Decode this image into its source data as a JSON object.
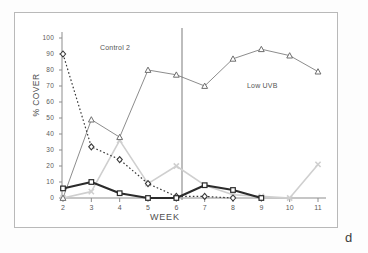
{
  "figure": {
    "panel_letter": "d",
    "annotations": [
      {
        "name": "control-2",
        "text": "Control 2"
      },
      {
        "name": "low-uvb",
        "text": "Low UVB"
      }
    ]
  },
  "chart_data": {
    "type": "line",
    "title": "",
    "xlabel": "WEEK",
    "ylabel": "% COVER",
    "xlim": [
      2,
      11
    ],
    "ylim": [
      0,
      100
    ],
    "grid": false,
    "legend": "none",
    "xticks": [
      "2",
      "3",
      "4",
      "5",
      "6",
      "7",
      "8",
      "9",
      "10",
      "11"
    ],
    "yticks": [
      "0",
      "10",
      "20",
      "30",
      "40",
      "50",
      "60",
      "70",
      "80",
      "90",
      "100"
    ],
    "x": [
      2,
      3,
      4,
      5,
      6,
      7,
      8,
      9,
      10,
      11
    ],
    "annotations": [
      {
        "text": "Control 2",
        "x": 3.3,
        "y": 95
      },
      {
        "text": "Low UVB",
        "x": 8.5,
        "y": 70
      },
      {
        "text": "d",
        "x": 11.5,
        "y": -10
      }
    ],
    "vertical_divider": {
      "x": 6.2,
      "label": "treatment-start",
      "color": "#9a9a9a"
    },
    "series": [
      {
        "name": "series-diamond-dotted",
        "marker": "diamond",
        "linestyle": "dotted",
        "color": "#3a3a3a",
        "x": [
          2,
          3,
          4,
          5,
          6,
          7,
          8
        ],
        "values": [
          90,
          32,
          24,
          9,
          1,
          1,
          0
        ]
      },
      {
        "name": "series-triangle",
        "marker": "triangle",
        "linestyle": "solid-thin",
        "color": "#6e6e6e",
        "x": [
          2,
          3,
          4,
          5,
          6,
          7,
          8,
          9,
          10,
          11
        ],
        "values": [
          0,
          49,
          38,
          80,
          77,
          70,
          87,
          93,
          89,
          79
        ]
      },
      {
        "name": "series-x-grey",
        "marker": "x",
        "linestyle": "solid-light",
        "color": "#cfcfcf",
        "x": [
          2,
          3,
          4,
          5,
          6,
          7,
          8,
          9,
          10,
          11
        ],
        "values": [
          0,
          4,
          36,
          9,
          20,
          8,
          2,
          1,
          0,
          21
        ]
      },
      {
        "name": "series-square-bold",
        "marker": "square",
        "linestyle": "solid-bold",
        "color": "#2b2b2b",
        "x": [
          2,
          3,
          4,
          5,
          6,
          7,
          8,
          9
        ],
        "values": [
          6,
          10,
          3,
          0,
          0,
          8,
          5,
          0
        ]
      }
    ]
  }
}
